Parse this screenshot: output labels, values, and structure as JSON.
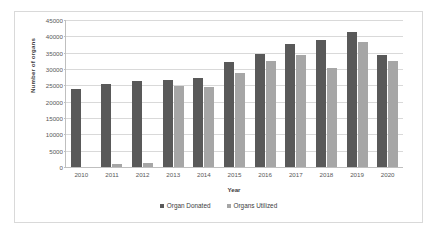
{
  "chart_data": {
    "type": "bar",
    "title": "",
    "xlabel": "Year",
    "ylabel": "Number of organs",
    "categories": [
      "2010",
      "2011",
      "2012",
      "2013",
      "2014",
      "2015",
      "2016",
      "2017",
      "2018",
      "2019",
      "2020"
    ],
    "series": [
      {
        "name": "Organ Donated",
        "color": "#595959",
        "values": [
          24000,
          25500,
          26200,
          26600,
          27400,
          32000,
          34500,
          37800,
          38900,
          41200,
          34300
        ]
      },
      {
        "name": "Organs Utilized",
        "color": "#a6a6a6",
        "values": [
          0,
          1000,
          1300,
          24700,
          24500,
          28700,
          32500,
          34400,
          30300,
          38400,
          32400
        ]
      }
    ],
    "ylim": [
      0,
      45000
    ],
    "ytick_labels": [
      "0",
      "5000",
      "10000",
      "15000",
      "20000",
      "25000",
      "30000",
      "35000",
      "40000",
      "45000"
    ],
    "ytick_values": [
      0,
      5000,
      10000,
      15000,
      20000,
      25000,
      30000,
      35000,
      40000,
      45000
    ],
    "grid": true,
    "legend_position": "bottom"
  }
}
